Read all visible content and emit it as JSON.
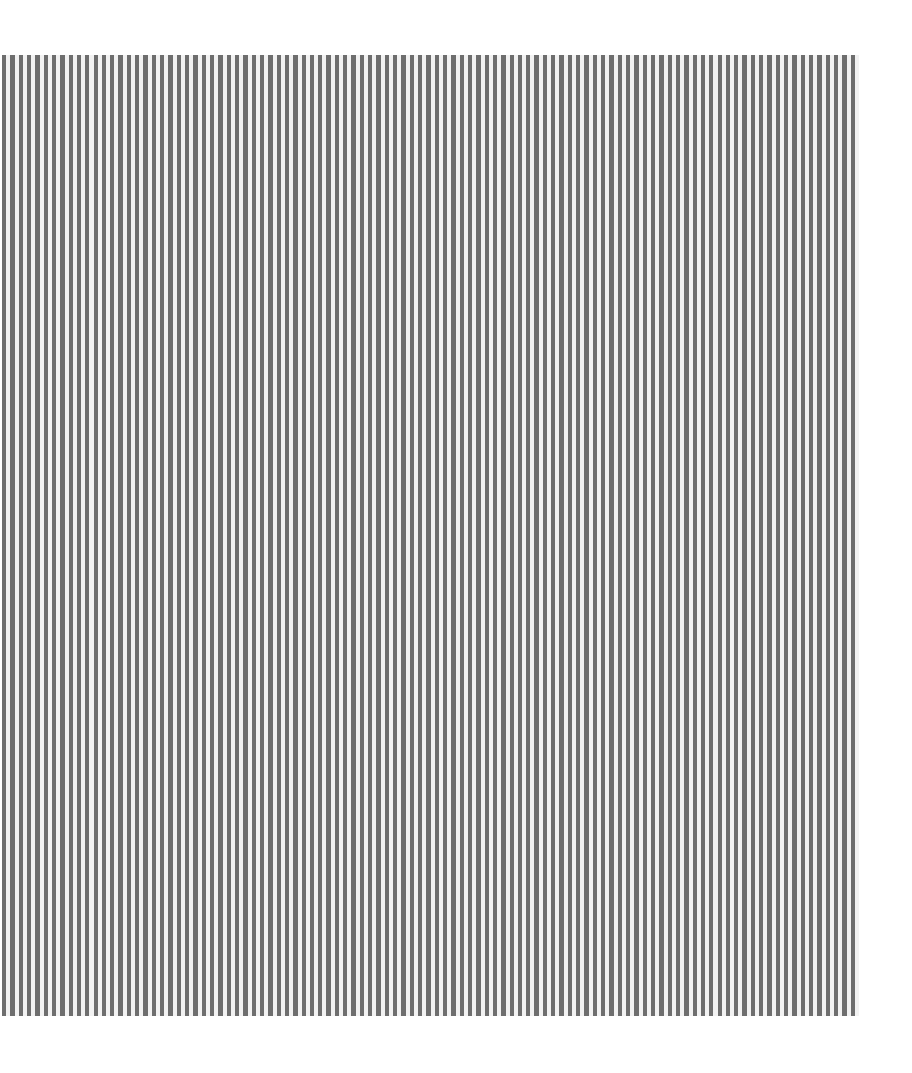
{
  "pattern": {
    "type": "vertical-stripes",
    "stripe_color": "#6e6e6e",
    "gap_color": "#f2f2f2",
    "background": "#ffffff",
    "stripe_count": 103
  }
}
